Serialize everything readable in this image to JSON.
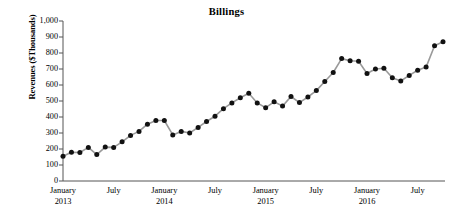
{
  "chart_data": {
    "type": "line",
    "title": "Billings",
    "xlabel": "",
    "ylabel": "Revenues ($Thousands)",
    "ylim": [
      0,
      1000
    ],
    "ytick_labels": [
      "1,000",
      "900",
      "800",
      "700",
      "600",
      "500",
      "400",
      "300",
      "200",
      "100",
      "0"
    ],
    "ytick_values": [
      1000,
      900,
      800,
      700,
      600,
      500,
      400,
      300,
      200,
      100,
      0
    ],
    "grid": false,
    "legend": null,
    "marker": "filled-circle",
    "marker_color": "#111111",
    "line_color": "#9a9a9a",
    "xtick_labels": [
      {
        "month": "January",
        "year": "2013"
      },
      {
        "month": "July",
        "year": ""
      },
      {
        "month": "January",
        "year": "2014"
      },
      {
        "month": "July",
        "year": ""
      },
      {
        "month": "January",
        "year": "2015"
      },
      {
        "month": "July",
        "year": ""
      },
      {
        "month": "January",
        "year": "2016"
      },
      {
        "month": "July",
        "year": ""
      }
    ],
    "x": [
      "2013-01",
      "2013-02",
      "2013-03",
      "2013-04",
      "2013-05",
      "2013-06",
      "2013-07",
      "2013-08",
      "2013-09",
      "2013-10",
      "2013-11",
      "2013-12",
      "2014-01",
      "2014-02",
      "2014-03",
      "2014-04",
      "2014-05",
      "2014-06",
      "2014-07",
      "2014-08",
      "2014-09",
      "2014-10",
      "2014-11",
      "2014-12",
      "2015-01",
      "2015-02",
      "2015-03",
      "2015-04",
      "2015-05",
      "2015-06",
      "2015-07",
      "2015-08",
      "2015-09",
      "2015-10",
      "2015-11",
      "2015-12",
      "2016-01",
      "2016-02",
      "2016-03",
      "2016-04",
      "2016-05",
      "2016-06",
      "2016-07",
      "2016-08",
      "2016-09",
      "2016-10",
      "2016-11",
      "2016-12"
    ],
    "values": [
      155,
      180,
      178,
      210,
      165,
      212,
      210,
      245,
      285,
      310,
      355,
      378,
      378,
      288,
      310,
      300,
      335,
      372,
      405,
      452,
      488,
      520,
      548,
      488,
      458,
      495,
      468,
      528,
      490,
      525,
      565,
      622,
      678,
      765,
      752,
      748,
      672,
      700,
      705,
      645,
      625,
      660,
      692,
      712,
      845,
      870,
      0,
      0
    ],
    "values_note": "Monthly billings revenue in $ thousands, January 2013 - October 2016",
    "n_points": 46
  }
}
